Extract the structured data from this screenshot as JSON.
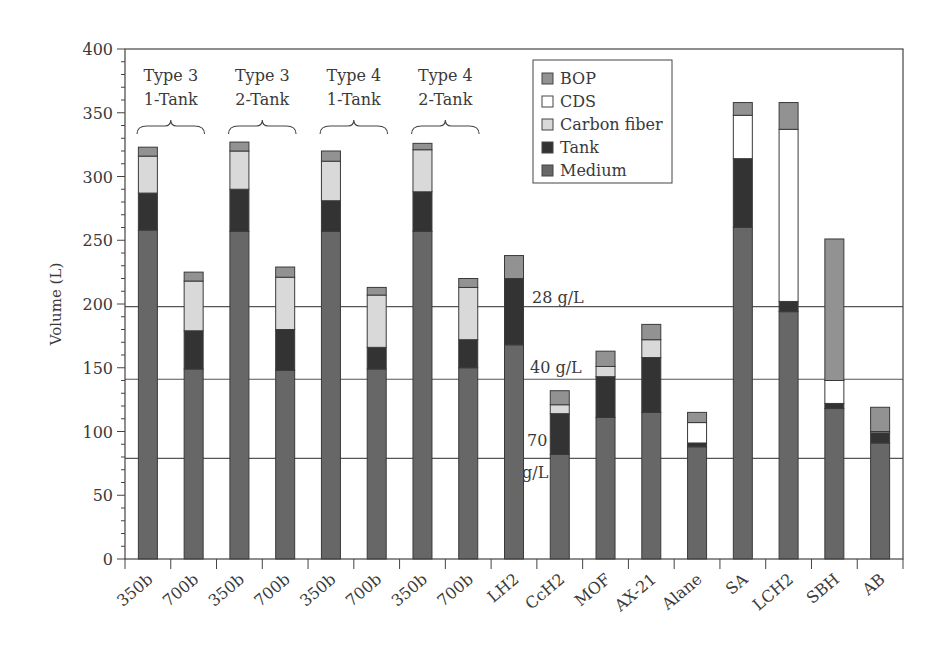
{
  "chart_data": {
    "type": "bar",
    "stacked": true,
    "title": "",
    "xlabel": "",
    "ylabel": "Volume (L)",
    "ylim": [
      0,
      400
    ],
    "yticks": [
      0,
      50,
      100,
      150,
      200,
      250,
      300,
      350,
      400
    ],
    "grid": false,
    "legend_position": "upper center-right",
    "categories": [
      "350b",
      "700b",
      "350b",
      "700b",
      "350b",
      "700b",
      "350b",
      "700b",
      "LH2",
      "CcH2",
      "MOF",
      "AX-21",
      "Alane",
      "SA",
      "LCH2",
      "SBH",
      "AB"
    ],
    "series": [
      {
        "name": "Medium",
        "color": "#676767",
        "values": [
          258,
          149,
          257,
          148,
          257,
          149,
          257,
          150,
          168,
          82,
          111,
          115,
          88,
          260,
          194,
          118,
          91
        ]
      },
      {
        "name": "Tank",
        "color": "#333333",
        "values": [
          29,
          30,
          33,
          32,
          24,
          17,
          31,
          22,
          52,
          32,
          32,
          43,
          3,
          54,
          8,
          4,
          8
        ]
      },
      {
        "name": "Carbon fiber",
        "color": "#d9d9d9",
        "values": [
          29,
          39,
          30,
          41,
          31,
          41,
          33,
          41,
          0,
          7,
          8,
          14,
          0,
          0,
          0,
          0,
          0
        ]
      },
      {
        "name": "CDS",
        "color": "#ffffff",
        "values": [
          0,
          0,
          0,
          0,
          0,
          0,
          0,
          0,
          0,
          0,
          0,
          0,
          16,
          34,
          135,
          18,
          1
        ]
      },
      {
        "name": "BOP",
        "color": "#929292",
        "values": [
          7,
          7,
          7,
          8,
          8,
          6,
          5,
          7,
          18,
          11,
          12,
          12,
          8,
          10,
          21,
          111,
          19
        ]
      }
    ],
    "legend": [
      "BOP",
      "CDS",
      "Carbon fiber",
      "Tank",
      "Medium"
    ],
    "group_annotations": [
      {
        "line1": "Type 3",
        "line2": "1-Tank",
        "spans": [
          0,
          1
        ]
      },
      {
        "line1": "Type 3",
        "line2": "2-Tank",
        "spans": [
          2,
          3
        ]
      },
      {
        "line1": "Type 4",
        "line2": "1-Tank",
        "spans": [
          4,
          5
        ]
      },
      {
        "line1": "Type 4",
        "line2": "2-Tank",
        "spans": [
          6,
          7
        ]
      }
    ],
    "reference_lines": [
      {
        "label": "28 g/L",
        "value": 198
      },
      {
        "label": "40 g/L",
        "value": 141
      },
      {
        "label": "70 g/L",
        "label_line1": "70",
        "label_line2": "g/L",
        "value": 79
      }
    ]
  }
}
